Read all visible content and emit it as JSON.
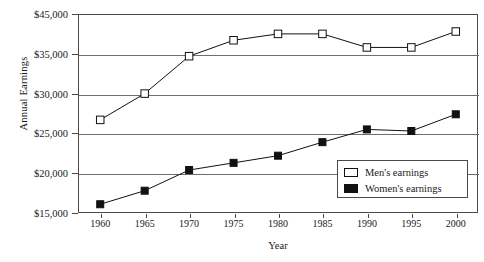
{
  "chart_data": {
    "type": "line",
    "title": "",
    "xlabel": "Year",
    "ylabel": "Annual Earnings",
    "grid": true,
    "legend_position": "bottom-right",
    "categories": [
      1960,
      1965,
      1970,
      1975,
      1980,
      1985,
      1990,
      1995,
      2000
    ],
    "x_tick_labels": [
      "1960",
      "1965",
      "1970",
      "1975",
      "1980",
      "1985",
      "1990",
      "1995",
      "2000"
    ],
    "y_tick_labels": [
      "$45,000",
      "$35,000",
      "$30,000",
      "$25,000",
      "$20,000",
      "$15,000"
    ],
    "y_tick_values": [
      45000,
      35000,
      30000,
      25000,
      20000,
      15000
    ],
    "ylim": [
      15000,
      45000
    ],
    "xlim": [
      1960,
      2000
    ],
    "series": [
      {
        "name": "Men's earnings",
        "marker": "open-square",
        "color": "#ffffff",
        "edge_color": "#111111",
        "values": [
          26700,
          30000,
          34700,
          36700,
          37500,
          37500,
          35800,
          35800,
          37800
        ]
      },
      {
        "name": "Women's earnings",
        "marker": "filled-square",
        "color": "#111111",
        "edge_color": "#111111",
        "values": [
          16100,
          17800,
          20400,
          21300,
          22200,
          23900,
          25500,
          25300,
          27400
        ]
      }
    ],
    "legend": [
      {
        "label": "Men's earnings",
        "marker": "open-square"
      },
      {
        "label": "Women's earnings",
        "marker": "filled-square"
      }
    ]
  }
}
